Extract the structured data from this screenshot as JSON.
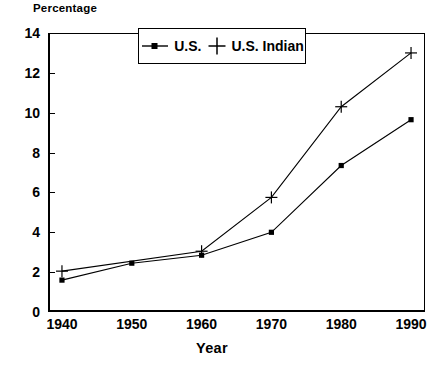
{
  "chart_data": {
    "type": "line",
    "title": "",
    "ylabel": "Percentage",
    "xlabel": "Year",
    "x": [
      1940,
      1950,
      1960,
      1970,
      1980,
      1990
    ],
    "xtick_labels": [
      "1940",
      "1950",
      "1960",
      "1970",
      "1980",
      "1990"
    ],
    "ytick_labels": [
      "0",
      "2",
      "4",
      "6",
      "8",
      "10",
      "12",
      "14"
    ],
    "yticks": [
      0,
      2,
      4,
      6,
      8,
      10,
      12,
      14
    ],
    "xlim": [
      1938,
      1992
    ],
    "ylim": [
      0,
      14
    ],
    "grid": false,
    "legend_position": "top-center",
    "series": [
      {
        "name": "U.S.",
        "marker": "square",
        "values": [
          1.6,
          2.45,
          2.85,
          4.0,
          7.35,
          9.65
        ]
      },
      {
        "name": "U.S. Indian",
        "marker": "plus",
        "values": [
          2.05,
          null,
          3.05,
          5.75,
          10.3,
          13.0
        ]
      }
    ],
    "colors": {
      "line": "#000000",
      "axis": "#000000",
      "background": "#ffffff"
    }
  },
  "legend": {
    "items": [
      {
        "label": "U.S.",
        "icon": "square-marker-icon"
      },
      {
        "label": "U.S. Indian",
        "icon": "plus-marker-icon"
      }
    ]
  }
}
